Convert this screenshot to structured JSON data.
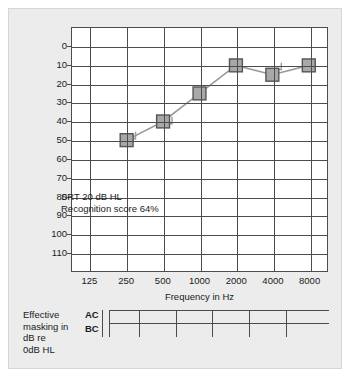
{
  "figure": {
    "background_color": "#ececec",
    "plot_background_color": "#ffffff",
    "axis_color": "#4c4c4c",
    "marker_fill_color": "#a8a8a8",
    "marker_edge_color": "#555555",
    "line_color": "#9a9a9a"
  },
  "chart_data": {
    "type": "line",
    "title": "",
    "xlabel": "Frequency in Hz",
    "ylabel": "Hearing level in dB re ANSI, 1969",
    "categories": [
      "125",
      "250",
      "500",
      "1000",
      "2000",
      "4000",
      "8000"
    ],
    "xticklabels": [
      "125",
      "250",
      "500",
      "1000",
      "2000",
      "4000",
      "8000"
    ],
    "yticklabels": [
      "0",
      "10",
      "20",
      "30",
      "40",
      "50",
      "60",
      "70",
      "80",
      "90",
      "100",
      "110"
    ],
    "ylim": [
      -10,
      110
    ],
    "y_inverted": true,
    "grid": true,
    "legend": "none",
    "series": [
      {
        "name": "Air conduction masked (right)",
        "symbol": "square",
        "x": [
          "250",
          "500",
          "1000",
          "2000",
          "4000",
          "8000"
        ],
        "values": [
          50,
          40,
          25,
          10,
          15,
          10
        ]
      }
    ],
    "masking_brackets": [
      {
        "frequency": "250",
        "level": 45
      },
      {
        "frequency": "500",
        "level": 37
      },
      {
        "frequency": "4000",
        "level": 8
      }
    ],
    "annotations": [
      "SRT 20 dB HL",
      "Recognition score 64%"
    ]
  },
  "annotation": {
    "line1": "SRT 20 dB HL",
    "line2": "Recognition score 64%"
  },
  "masking": {
    "caption_lines": [
      "Effective",
      "masking in",
      "dB re",
      "0dB HL"
    ],
    "caption_line1": "Effective",
    "caption_line2": "masking in",
    "caption_line3": "dB re",
    "caption_line4": "0dB HL",
    "rows": [
      {
        "label": "AC",
        "values": [
          "",
          "",
          "",
          "",
          "",
          ""
        ]
      },
      {
        "label": "BC",
        "values": [
          "",
          "",
          "",
          "",
          "",
          ""
        ]
      }
    ],
    "row_ac_label": "AC",
    "row_bc_label": "BC"
  }
}
